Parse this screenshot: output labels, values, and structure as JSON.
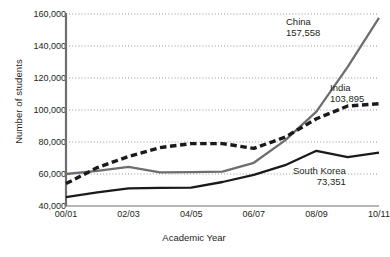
{
  "chart_data": {
    "type": "line",
    "title": "",
    "xlabel": "Academic Year",
    "ylabel": "Number of students",
    "x": [
      "00/01",
      "01/02",
      "02/03",
      "03/04",
      "04/05",
      "05/06",
      "06/07",
      "07/08",
      "08/09",
      "09/10",
      "10/11"
    ],
    "xtick_labels": [
      "00/01",
      "02/03",
      "04/05",
      "06/07",
      "08/09",
      "10/11"
    ],
    "xtick_values": [
      "00/01",
      "02/03",
      "04/05",
      "06/07",
      "08/09",
      "10/11"
    ],
    "ytick_labels": [
      "40,000",
      "60,000",
      "80,000",
      "100,000",
      "120,000",
      "140,000",
      "160,000"
    ],
    "ytick_values": [
      40000,
      60000,
      80000,
      100000,
      120000,
      140000,
      160000
    ],
    "ylim": [
      40000,
      160000
    ],
    "grid": "horizontal-dotted",
    "legend": "inline-end-labels",
    "series": [
      {
        "name": "China",
        "style": "solid",
        "color": "#6d6e70",
        "end_value": 157558,
        "end_value_label": "157,558",
        "values": [
          60000,
          62000,
          64500,
          61000,
          61200,
          61500,
          67000,
          81000,
          99000,
          127000,
          157558
        ]
      },
      {
        "name": "India",
        "style": "dashed",
        "color": "#1a1a1a",
        "end_value": 103895,
        "end_value_label": "103,895",
        "values": [
          54000,
          64000,
          71000,
          76500,
          79000,
          79000,
          76000,
          83000,
          94500,
          102500,
          103895
        ]
      },
      {
        "name": "South Korea",
        "style": "solid",
        "color": "#1a1a1a",
        "end_value": 73351,
        "end_value_label": "73,351",
        "values": [
          45500,
          48500,
          51000,
          51300,
          51500,
          55000,
          59500,
          65500,
          74500,
          70500,
          73351
        ]
      }
    ]
  },
  "labels": {
    "china_name": "China",
    "china_value": "157,558",
    "india_name": "India",
    "india_value": "103,895",
    "korea_name": "South Korea",
    "korea_value": "73,351"
  },
  "caption": ""
}
